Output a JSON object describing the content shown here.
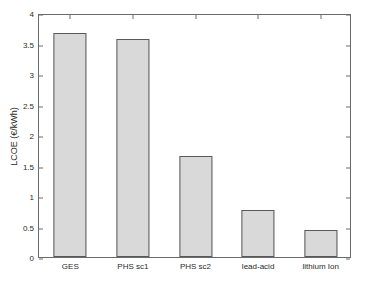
{
  "chart_data": {
    "type": "bar",
    "title": "",
    "subtitle": "",
    "xlabel": "",
    "ylabel": "LCOE (€/kWh)",
    "categories": [
      "GES",
      "PHS sc1",
      "PHS sc2",
      "lead-acid",
      "lithium Ion"
    ],
    "values": [
      3.68,
      3.58,
      1.66,
      0.77,
      0.45
    ],
    "ylim": [
      0,
      4
    ],
    "ytick_values": [
      0,
      0.5,
      1,
      1.5,
      2,
      2.5,
      3,
      3.5,
      4
    ],
    "ytick_labels": [
      "0",
      "0.5",
      "1",
      "1.5",
      "2",
      "2.5",
      "3",
      "3.5",
      "4"
    ],
    "grid": false,
    "legend": null,
    "legend_position": "none",
    "annotations": [],
    "colors": {
      "bar_fill": "#d9d9d9",
      "bar_edge": "#595959",
      "axis": "#6b6b6b",
      "text": "#2b2b2b",
      "background": "#ffffff"
    }
  }
}
